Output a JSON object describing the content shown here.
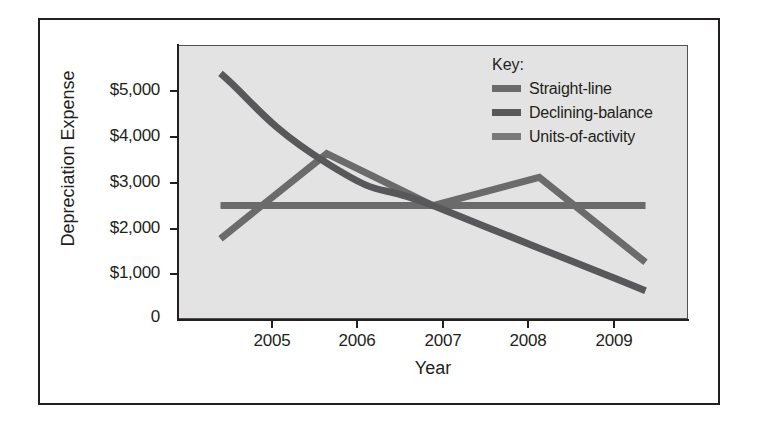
{
  "chart_data": {
    "type": "line",
    "title": "",
    "xlabel": "Year",
    "ylabel": "Depreciation Expense",
    "categories": [
      "2005",
      "2006",
      "2007",
      "2008",
      "2009"
    ],
    "x": [
      2005,
      2006,
      2007,
      2008,
      2009
    ],
    "xlim": [
      2004.6,
      2009.4
    ],
    "ylim": [
      0,
      5800
    ],
    "grid": false,
    "legend_position": "top-right",
    "legend_title": "Key:",
    "y_tick_labels": [
      "$5,000",
      "$4,000",
      "$3,000",
      "$2,000",
      "$1,000",
      "0"
    ],
    "y_tick_values": [
      5000,
      4000,
      3000,
      2000,
      1000,
      0
    ],
    "x_tick_labels": [
      "2005",
      "2006",
      "2007",
      "2008",
      "2009"
    ],
    "series": [
      {
        "name": "Straight-line",
        "color": "#6b6b6b",
        "values": [
          2400,
          2400,
          2400,
          2400,
          2400
        ],
        "curve": "linear"
      },
      {
        "name": "Declining-balance",
        "color": "#58585a",
        "values": [
          5200,
          3300,
          2400,
          1500,
          600
        ],
        "curve": "smooth"
      },
      {
        "name": "Units-of-activity",
        "color": "#6b6b6b",
        "values": [
          1700,
          3500,
          2400,
          3000,
          1200
        ],
        "curve": "linear"
      }
    ]
  },
  "axis": {
    "y_title": "Depreciation Expense",
    "x_title": "Year"
  },
  "legend": {
    "title": "Key:",
    "items": [
      {
        "label": "Straight-line",
        "color": "#6b6b6b"
      },
      {
        "label": "Declining-balance",
        "color": "#58585a"
      },
      {
        "label": "Units-of-activity",
        "color": "#7a7a7a"
      }
    ]
  },
  "colors": {
    "plot_background": "#e3e3e3",
    "frame_border": "#231f20",
    "axis": "#231f20",
    "page_background": "#ffffff"
  }
}
